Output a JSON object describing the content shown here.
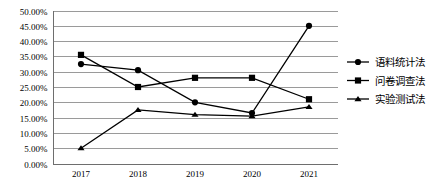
{
  "chart_data": {
    "type": "line",
    "title": "",
    "subtitle": "",
    "xlabel": "",
    "ylabel": "",
    "categories": [
      "2017",
      "2018",
      "2019",
      "2020",
      "2021"
    ],
    "ylim": [
      0,
      50
    ],
    "ytick_step": 5,
    "ytick_labels": [
      "0.00%",
      "5.00%",
      "10.00%",
      "15.00%",
      "20.00%",
      "25.00%",
      "30.00%",
      "35.00%",
      "40.00%",
      "45.00%",
      "50.00%"
    ],
    "ytick_values": [
      0,
      5,
      10,
      15,
      20,
      25,
      30,
      35,
      40,
      45,
      50
    ],
    "grid": true,
    "grid_axis": "y",
    "legend_position": "right",
    "value_unit": "percent",
    "series": [
      {
        "name": "语料统计法",
        "marker": "circle",
        "color": "#000000",
        "values": [
          32.5,
          30.5,
          20.0,
          16.5,
          45.0
        ]
      },
      {
        "name": "问卷调查法",
        "marker": "square",
        "color": "#000000",
        "values": [
          35.5,
          25.0,
          28.0,
          28.0,
          21.0
        ]
      },
      {
        "name": "实验测试法",
        "marker": "triangle",
        "color": "#000000",
        "values": [
          5.0,
          17.5,
          16.0,
          15.5,
          18.5
        ]
      }
    ]
  },
  "legend": {
    "items": [
      {
        "label": "语料统计法",
        "marker": "circle-marker"
      },
      {
        "label": "问卷调查法",
        "marker": "square-marker"
      },
      {
        "label": "实验测试法",
        "marker": "triangle-marker"
      }
    ]
  }
}
